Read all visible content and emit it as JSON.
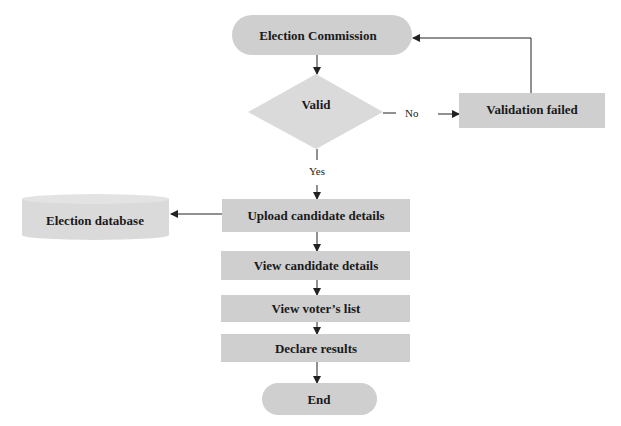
{
  "diagram": {
    "type": "flowchart",
    "nodes": {
      "start": {
        "label": "Election Commission",
        "shape": "terminator"
      },
      "valid": {
        "label": "Valid",
        "shape": "decision"
      },
      "failed": {
        "label": "Validation failed",
        "shape": "process"
      },
      "upload": {
        "label": "Upload candidate details",
        "shape": "process"
      },
      "database": {
        "label": "Election database",
        "shape": "database"
      },
      "view_candidate": {
        "label": "View candidate details",
        "shape": "process"
      },
      "view_voters": {
        "label": "View voter’s list",
        "shape": "process"
      },
      "declare": {
        "label": "Declare results",
        "shape": "process"
      },
      "end": {
        "label": "End",
        "shape": "terminator"
      }
    },
    "edges": {
      "no_label": "No",
      "yes_label": "Yes"
    },
    "connections": [
      {
        "from": "Election Commission",
        "to": "Valid"
      },
      {
        "from": "Valid",
        "to": "Validation failed",
        "label": "No"
      },
      {
        "from": "Validation failed",
        "to": "Election Commission"
      },
      {
        "from": "Valid",
        "to": "Upload candidate details",
        "label": "Yes"
      },
      {
        "from": "Upload candidate details",
        "to": "Election database"
      },
      {
        "from": "Upload candidate details",
        "to": "View candidate details"
      },
      {
        "from": "View candidate details",
        "to": "View voter’s list"
      },
      {
        "from": "View voter’s list",
        "to": "Declare results"
      },
      {
        "from": "Declare results",
        "to": "End"
      }
    ],
    "colors": {
      "node_fill": "#cfcfcf",
      "line": "#222222",
      "text": "#1a1a1a"
    }
  }
}
